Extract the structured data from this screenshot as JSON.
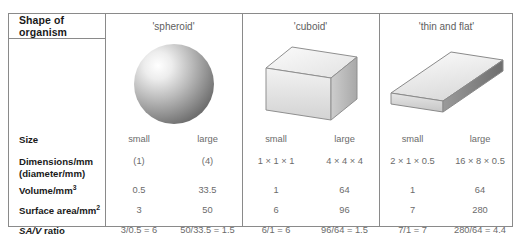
{
  "table": {
    "header_label": "Shape of organism",
    "columns": [
      {
        "name": "'spheroid'"
      },
      {
        "name": "'cuboid'"
      },
      {
        "name": "'thin and flat'"
      }
    ],
    "row_labels": [
      "Size",
      "Dimensions/mm",
      "(diameter/mm)",
      "Volume/mm",
      "Surface area/mm",
      "SA/V",
      " ratio"
    ],
    "superscripts": {
      "volume": "3",
      "surface_area": "2"
    },
    "shapes": {
      "spheroid": "sphere-illustration",
      "cuboid": "cuboid-illustration",
      "thin_and_flat": "slab-illustration"
    },
    "rows": [
      {
        "label": "Size",
        "values": [
          "small",
          "large",
          "small",
          "large",
          "small",
          "large"
        ]
      },
      {
        "label": "Dimensions/mm (diameter/mm)",
        "values": [
          "(1)",
          "(4)",
          "1 × 1 × 1",
          "4 × 4 × 4",
          "2 × 1 × 0.5",
          "16 × 8 × 0.5"
        ]
      },
      {
        "label": "Volume/mm3",
        "values": [
          "0.5",
          "33.5",
          "1",
          "64",
          "1",
          "64"
        ]
      },
      {
        "label": "Surface area/mm2",
        "values": [
          "3",
          "50",
          "6",
          "96",
          "7",
          "280"
        ]
      },
      {
        "label": "SA/V ratio",
        "values": [
          "3/0.5 = 6",
          "50/33.5 = 1.5",
          "6/1 = 6",
          "96/64 = 1.5",
          "7/1 = 7",
          "280/64 = 4.4"
        ]
      }
    ]
  },
  "colors": {
    "border": "#8a8a8a",
    "label_text": "#1a1a1a",
    "value_text": "#6b6b6b",
    "header_text": "#5e5e5e",
    "background": "#ffffff"
  }
}
